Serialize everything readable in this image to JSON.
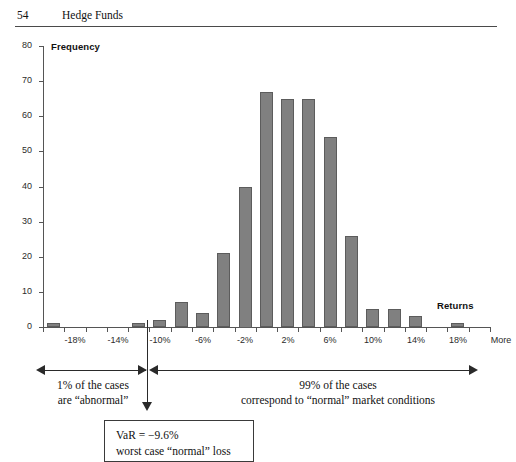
{
  "header": {
    "page_number": "54",
    "book_title": "Hedge Funds"
  },
  "chart_data": {
    "type": "bar",
    "title": "",
    "xlabel": "Returns",
    "ylabel": "Frequency",
    "ylim": [
      0,
      80
    ],
    "ytick_labels": [
      "0",
      "10",
      "20",
      "30",
      "40",
      "50",
      "60",
      "70",
      "80"
    ],
    "ytick_values": [
      0,
      10,
      20,
      30,
      40,
      50,
      60,
      70,
      80
    ],
    "xtick_labels": [
      "-18%",
      "-14%",
      "-10%",
      "-6%",
      "-2%",
      "2%",
      "6%",
      "10%",
      "14%",
      "18%",
      "More"
    ],
    "grid": false,
    "legend": false,
    "bar_color": "#808080",
    "bar_edge_color": "#5c5c5c",
    "categories": [
      "-20%",
      "-18%",
      "-16%",
      "-14%",
      "-12%",
      "-10%",
      "-8%",
      "-6%",
      "-4%",
      "-2%",
      "0%",
      "2%",
      "4%",
      "6%",
      "8%",
      "10%",
      "12%",
      "14%",
      "16%",
      "18%",
      "More"
    ],
    "values": [
      1,
      0,
      0,
      0,
      1,
      2,
      7,
      4,
      21,
      40,
      67,
      65,
      65,
      54,
      26,
      5,
      5,
      3,
      0,
      1,
      0
    ]
  },
  "annotations": {
    "left_region": "1% of the cases\nare “abnormal”",
    "right_region": "99% of the cases\ncorrespond to “normal” market conditions",
    "var_box": "VaR = −9.6%\nworst case “normal” loss",
    "var_value": "-9.6%"
  }
}
